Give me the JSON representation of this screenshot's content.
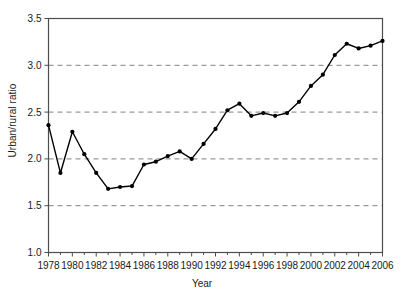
{
  "chart_data": {
    "type": "line",
    "title": "",
    "xlabel": "Year",
    "ylabel": "Urban/rural ratio",
    "x": [
      1978,
      1979,
      1980,
      1981,
      1982,
      1983,
      1984,
      1985,
      1986,
      1987,
      1988,
      1989,
      1990,
      1991,
      1992,
      1993,
      1994,
      1995,
      1996,
      1997,
      1998,
      1999,
      2000,
      2001,
      2002,
      2003,
      2004,
      2005,
      2006
    ],
    "values": [
      2.36,
      1.85,
      2.29,
      2.05,
      1.85,
      1.68,
      1.7,
      1.71,
      1.94,
      1.97,
      2.03,
      2.08,
      2.0,
      2.16,
      2.32,
      2.52,
      2.59,
      2.46,
      2.49,
      2.46,
      2.49,
      2.61,
      2.78,
      2.9,
      3.11,
      3.23,
      3.18,
      3.21,
      3.26
    ],
    "series": [
      {
        "name": "Urban/rural ratio",
        "values": [
          2.36,
          1.85,
          2.29,
          2.05,
          1.85,
          1.68,
          1.7,
          1.71,
          1.94,
          1.97,
          2.03,
          2.08,
          2.0,
          2.16,
          2.32,
          2.52,
          2.59,
          2.46,
          2.49,
          2.46,
          2.49,
          2.61,
          2.78,
          2.9,
          3.11,
          3.23,
          3.18,
          3.21,
          3.26
        ]
      }
    ],
    "xlim": [
      1978,
      2006
    ],
    "ylim": [
      1.0,
      3.5
    ],
    "yticks": [
      1.0,
      1.5,
      2.0,
      2.5,
      3.0,
      3.5
    ],
    "ytick_labels": [
      "1.0",
      "1.5",
      "2.0",
      "2.5",
      "3.0",
      "3.5"
    ],
    "xticks": [
      1978,
      1980,
      1982,
      1984,
      1986,
      1988,
      1990,
      1992,
      1994,
      1996,
      1998,
      2000,
      2002,
      2004,
      2006
    ],
    "xtick_labels": [
      "1978",
      "1980",
      "1982",
      "1984",
      "1986",
      "1988",
      "1990",
      "1992",
      "1994",
      "1996",
      "1998",
      "2000",
      "2002",
      "2004",
      "2006"
    ],
    "minor_xticks": [
      1979,
      1981,
      1983,
      1985,
      1987,
      1989,
      1991,
      1993,
      1995,
      1997,
      1999,
      2001,
      2003,
      2005
    ],
    "grid": {
      "horizontal": true,
      "vertical": false,
      "style": "dashed",
      "at": [
        1.5,
        2.0,
        2.5,
        3.0
      ],
      "color": "#808080"
    },
    "legend": null,
    "marker": "filled-circle",
    "line_color": "#000000",
    "marker_color": "#000000",
    "background_color": "#ffffff",
    "axis_color": "#4d4d4d"
  },
  "axis": {
    "ylabel_text": "Urban/rural ratio",
    "xlabel_text": "Year"
  }
}
